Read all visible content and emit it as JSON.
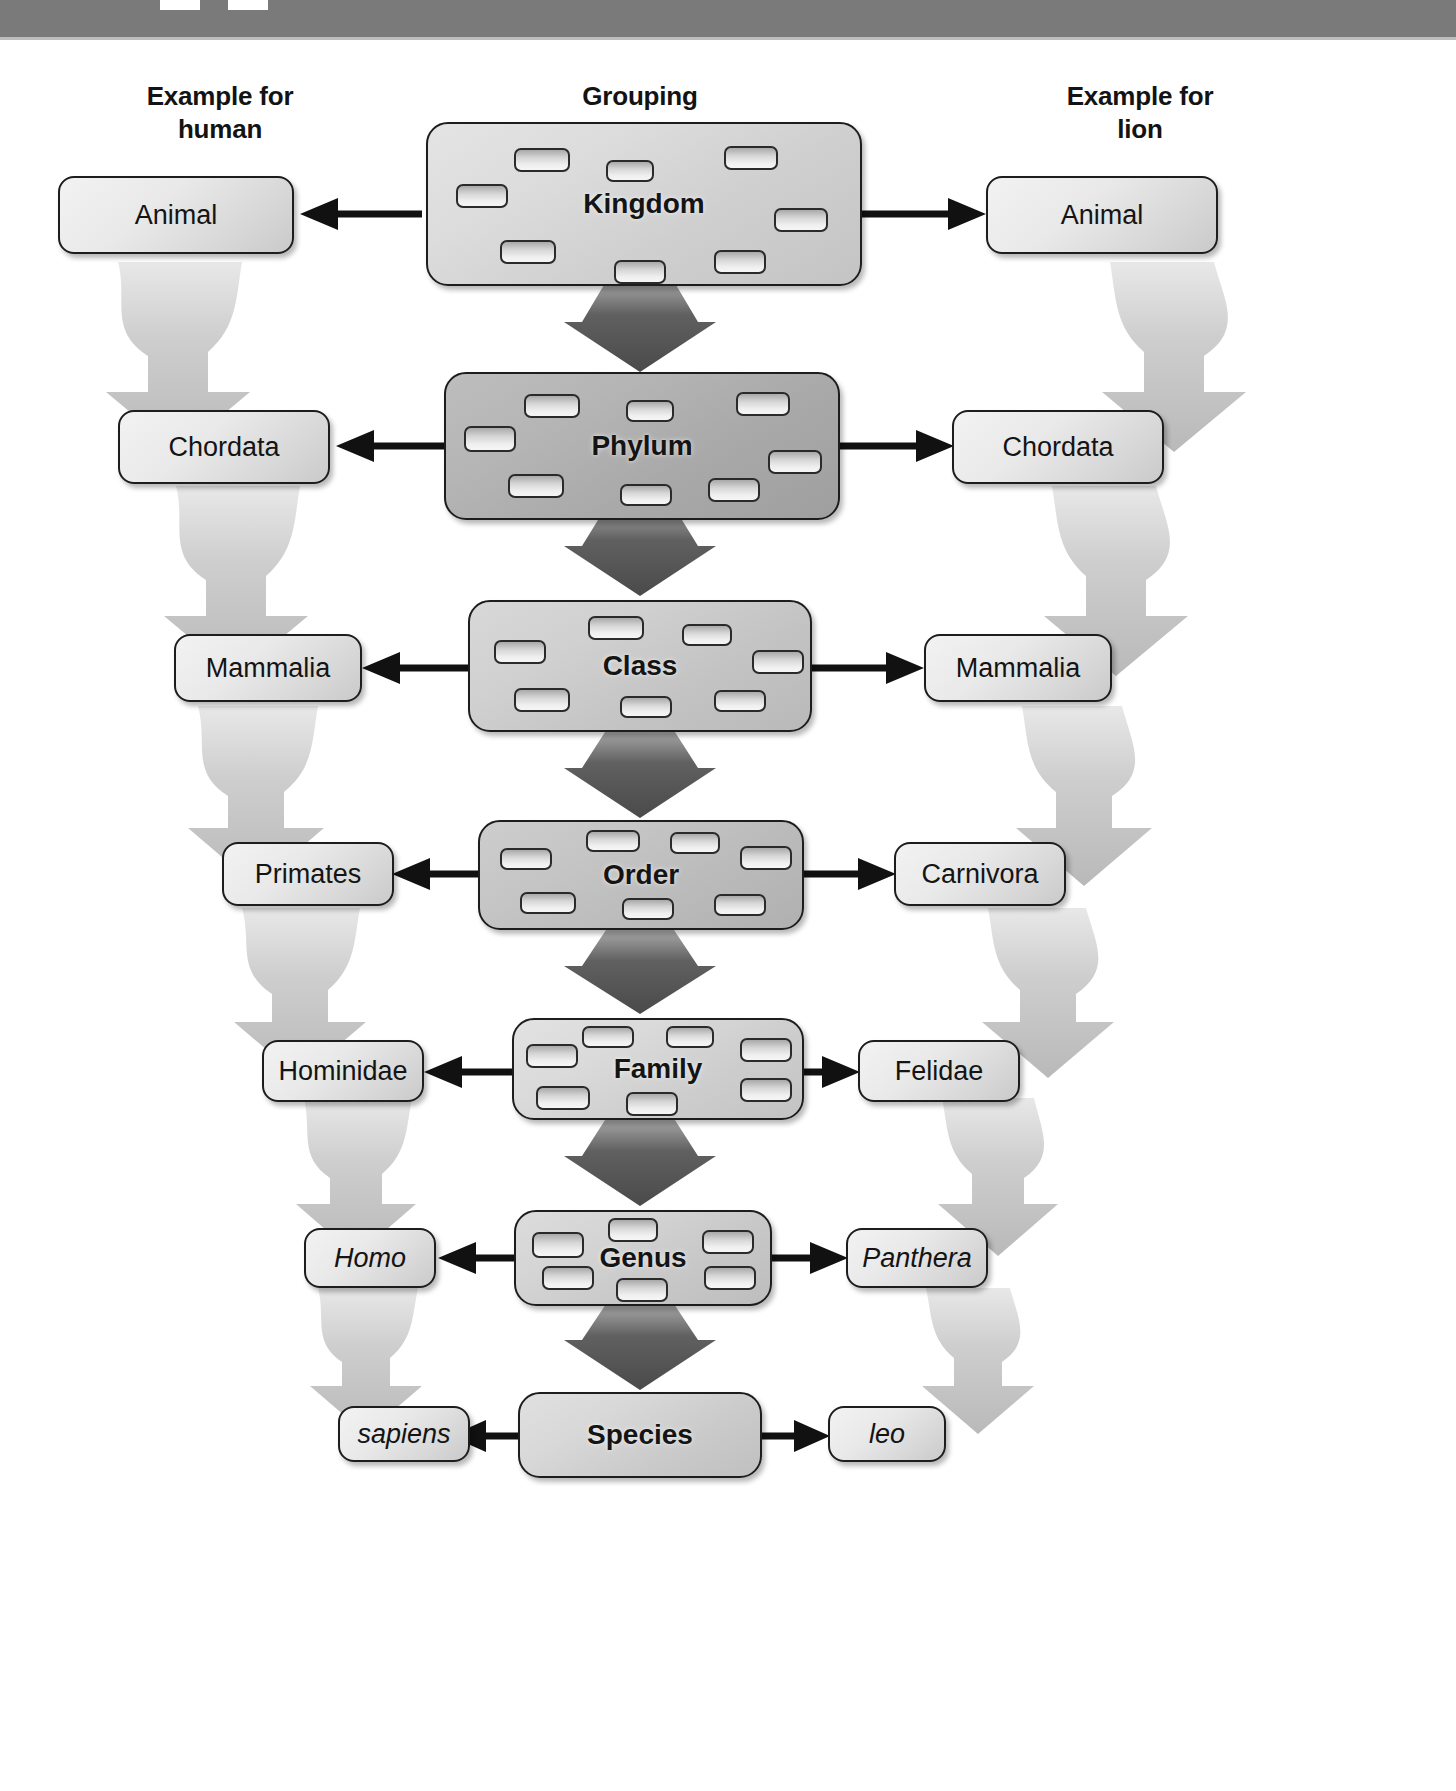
{
  "page": {
    "background_color": "#ffffff",
    "banner_color": "#7a7a7a"
  },
  "headers": {
    "left": "Example for\nhuman",
    "left_line1": "Example for",
    "left_line2": "human",
    "center": "Grouping",
    "right": "Example for\nlion",
    "right_line1": "Example for",
    "right_line2": "lion"
  },
  "colors": {
    "box_border": "#1d1d1d",
    "box_fill_light": "#ededed",
    "box_fill_dark": "#9f9f9f",
    "down_arrow_center": "#4b4b4b",
    "down_arrow_side": "#bfbfbf",
    "connector_arrow": "#111111",
    "text": "#141414"
  },
  "ranks": [
    {
      "id": "kingdom",
      "grouping": "Kingdom",
      "human": "Animal",
      "lion": "Animal",
      "human_italic": false,
      "lion_italic": false,
      "chip_count": 8,
      "shade": "shade-1"
    },
    {
      "id": "phylum",
      "grouping": "Phylum",
      "human": "Chordata",
      "lion": "Chordata",
      "human_italic": false,
      "lion_italic": false,
      "chip_count": 8,
      "shade": "shade-2"
    },
    {
      "id": "class",
      "grouping": "Class",
      "human": "Mammalia",
      "lion": "Mammalia",
      "human_italic": false,
      "lion_italic": false,
      "chip_count": 7,
      "shade": "shade-3"
    },
    {
      "id": "order",
      "grouping": "Order",
      "human": "Primates",
      "lion": "Carnivora",
      "human_italic": false,
      "lion_italic": false,
      "chip_count": 7,
      "shade": "shade-4"
    },
    {
      "id": "family",
      "grouping": "Family",
      "human": "Hominidae",
      "lion": "Felidae",
      "human_italic": false,
      "lion_italic": false,
      "chip_count": 7,
      "shade": "shade-5"
    },
    {
      "id": "genus",
      "grouping": "Genus",
      "human": "Homo",
      "lion": "Panthera",
      "human_italic": true,
      "lion_italic": true,
      "chip_count": 6,
      "shade": "shade-6"
    },
    {
      "id": "species",
      "grouping": "Species",
      "human": "sapiens",
      "lion": "leo",
      "human_italic": true,
      "lion_italic": true,
      "chip_count": 0,
      "shade": "shade-7"
    }
  ],
  "icons": {
    "down_arrow": "down-arrow-icon",
    "left_arrow": "left-arrow-icon",
    "right_arrow": "right-arrow-icon"
  }
}
